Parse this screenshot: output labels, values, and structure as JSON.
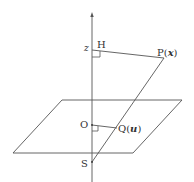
{
  "diagram": {
    "title": "",
    "labels": {
      "z": "z",
      "H": "H",
      "P": "P(",
      "P_var": "x",
      "P_close": ")",
      "O": "O",
      "Q": "Q(",
      "Q_var": "u",
      "Q_close": ")",
      "S": "S"
    },
    "colors": {
      "line": "#555555",
      "text": "#333333",
      "background": "#ffffff"
    },
    "elements": [
      "vertical axis with arrow",
      "plane (parallelogram)",
      "segment H-P",
      "segment P-S",
      "segment O-Q",
      "right-angle marker at H",
      "right-angle marker at O"
    ]
  }
}
